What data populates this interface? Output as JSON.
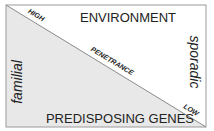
{
  "diagram": {
    "top_label": "ENVIRONMENT",
    "bottom_label": "PREDISPOSING GENES",
    "left_label": "familial",
    "right_label": "sporadic",
    "diagonal": {
      "high_label": "HIGH",
      "mid_label": "PENETRANCE",
      "low_label": "LOW"
    },
    "colors": {
      "fill": "#e8e8e8",
      "line": "#8a8a8a",
      "text": "#222222"
    }
  }
}
